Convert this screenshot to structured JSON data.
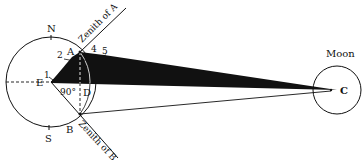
{
  "diagram": {
    "colors": {
      "ink": "#111111",
      "background": "#ffffff"
    },
    "earth": {
      "center_label": "E",
      "north_label": "N",
      "south_label": "S",
      "point_a_label": "A",
      "point_b_label": "B",
      "point_d_label": "D",
      "angle_label": "90°",
      "zenith_a_label": "Zenith of A",
      "zenith_b_label": "Zenith of B"
    },
    "moon": {
      "title": "Moon",
      "center_label": "C"
    },
    "angle_marks": [
      "1",
      "2",
      "4",
      "5"
    ]
  }
}
